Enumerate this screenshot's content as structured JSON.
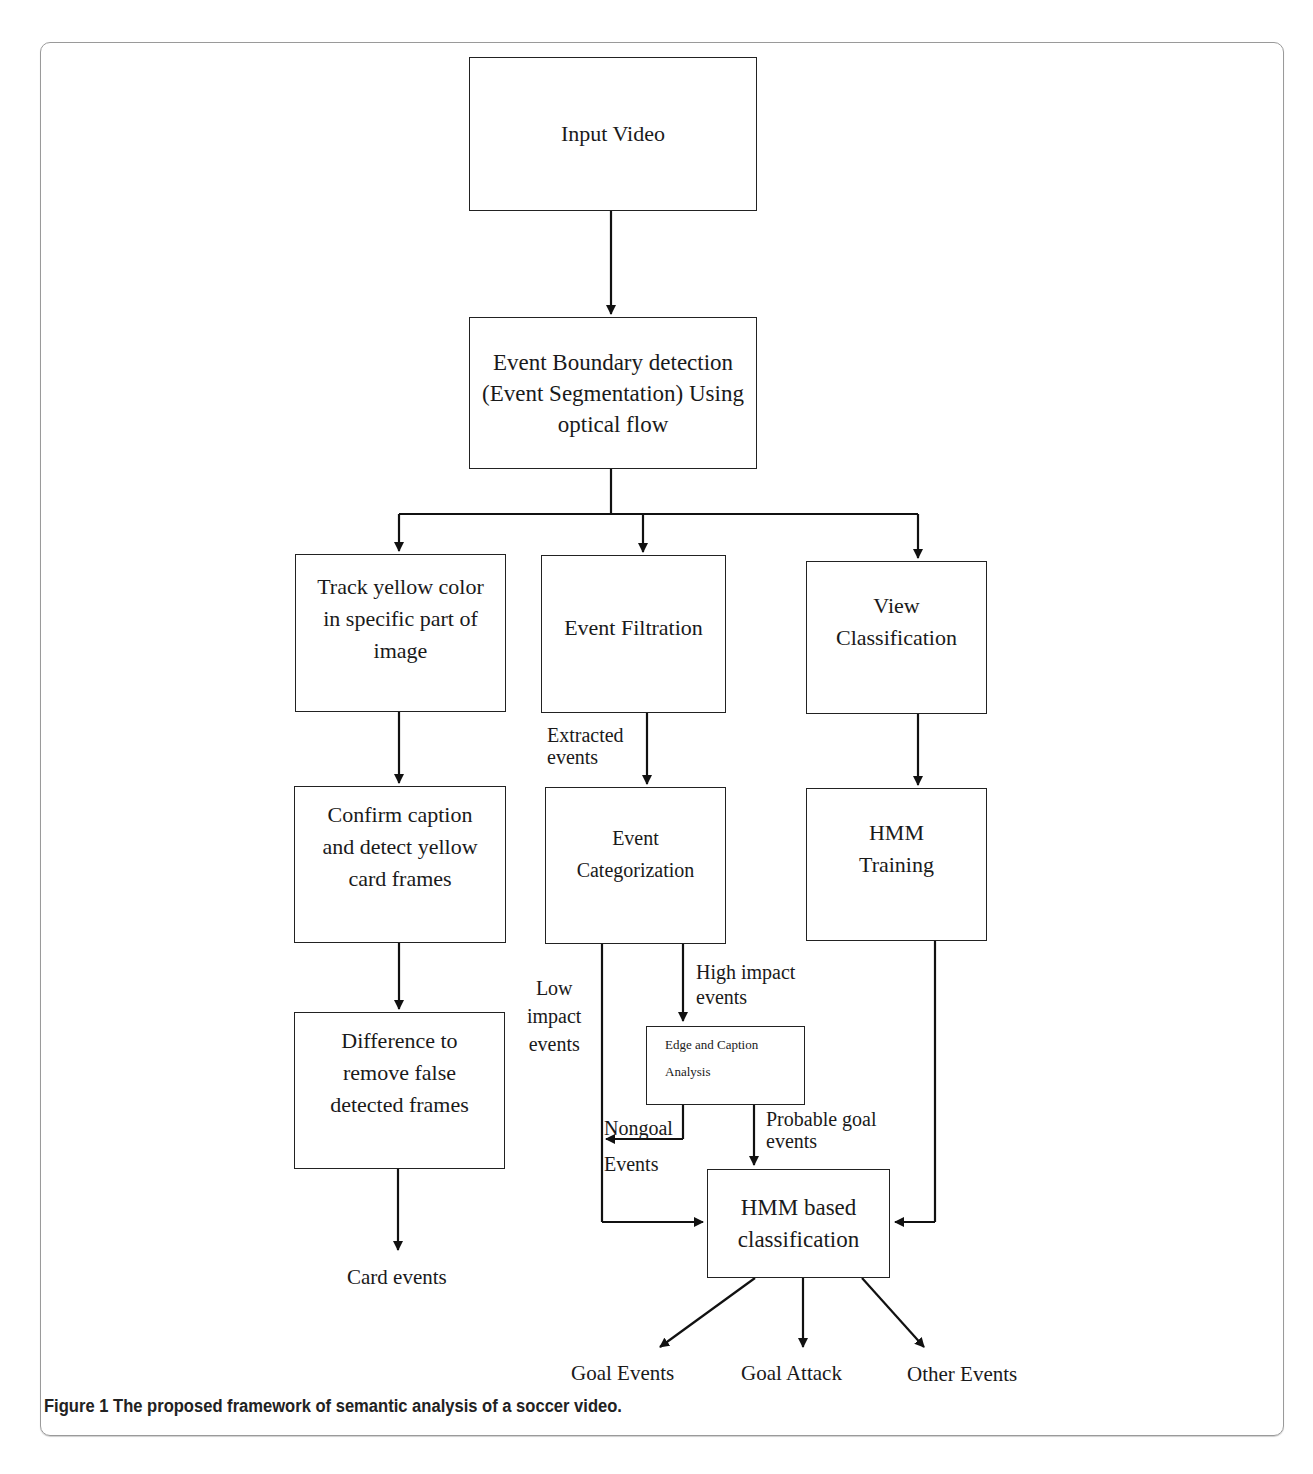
{
  "figure": {
    "caption_label": "Figure 1",
    "caption_text": "The proposed framework of semantic analysis of a soccer video."
  },
  "nodes": {
    "input_video": "Input Video",
    "event_boundary": [
      "Event Boundary detection",
      "(Event Segmentation) Using",
      "optical flow"
    ],
    "track_yellow": [
      "Track yellow color",
      "in specific part of",
      "image"
    ],
    "event_filtration": "Event Filtration",
    "view_classification": [
      "View",
      "Classification"
    ],
    "confirm_caption": [
      "Confirm caption",
      "and detect yellow",
      "card frames"
    ],
    "event_categorization": [
      "Event",
      "Categorization"
    ],
    "hmm_training": [
      "HMM",
      "Training"
    ],
    "difference": [
      "Difference to",
      "remove false",
      "detected frames"
    ],
    "edge_caption": [
      "Edge and Caption",
      "Analysis"
    ],
    "hmm_classification": [
      "HMM based",
      "classification"
    ]
  },
  "edge_labels": {
    "extracted_events": [
      "Extracted",
      "events"
    ],
    "high_impact": [
      "High impact",
      "events"
    ],
    "low_impact": [
      "Low",
      "impact",
      "events"
    ],
    "nongoal": [
      "Nongoal",
      "Events"
    ],
    "probable_goal": [
      "Probable goal",
      "events"
    ]
  },
  "outputs": {
    "card_events": "Card events",
    "goal_events": "Goal Events",
    "goal_attack": "Goal Attack",
    "other_events": "Other Events"
  }
}
